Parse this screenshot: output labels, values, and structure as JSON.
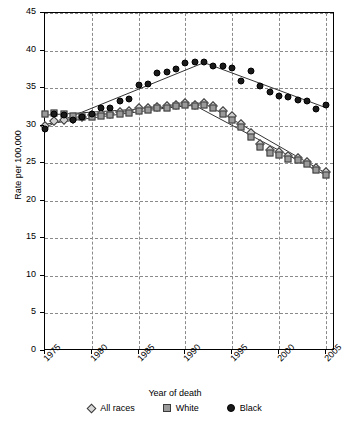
{
  "chart_data": {
    "type": "scatter",
    "title": "",
    "xlabel": "Year of death",
    "ylabel": "Rate per 100,000",
    "xlim": [
      1975,
      2006
    ],
    "ylim": [
      0,
      45
    ],
    "grid": true,
    "legend_position": "bottom",
    "ytick_labels": [
      "0",
      "5",
      "10",
      "15",
      "20",
      "25",
      "30",
      "35",
      "40",
      "45"
    ],
    "ytick_values": [
      0,
      5,
      10,
      15,
      20,
      25,
      30,
      35,
      40,
      45
    ],
    "xtick_labels": [
      "1975",
      "1980",
      "1985",
      "1990",
      "1995",
      "2000",
      "2005"
    ],
    "xtick_values": [
      1975,
      1980,
      1985,
      1990,
      1995,
      2000,
      2005
    ],
    "x": [
      1975,
      1976,
      1977,
      1978,
      1979,
      1980,
      1981,
      1982,
      1983,
      1984,
      1985,
      1986,
      1987,
      1988,
      1989,
      1990,
      1991,
      1992,
      1993,
      1994,
      1995,
      1996,
      1997,
      1998,
      1999,
      2000,
      2001,
      2002,
      2003,
      2004,
      2005
    ],
    "series": [
      {
        "name": "All races",
        "marker": "diamond",
        "color": "#cfcfcf",
        "values": [
          30.0,
          30.6,
          30.7,
          30.9,
          31.1,
          31.4,
          31.5,
          31.6,
          31.8,
          32.0,
          32.3,
          32.4,
          32.5,
          32.6,
          32.8,
          33.0,
          32.8,
          33.0,
          32.6,
          32.0,
          31.3,
          30.2,
          29.0,
          27.6,
          26.8,
          26.5,
          26.0,
          25.7,
          25.2,
          24.4,
          23.8
        ]
      },
      {
        "name": "White",
        "marker": "square",
        "color": "#9a9a9a",
        "values": [
          31.5,
          31.7,
          31.6,
          31.3,
          31.1,
          31.2,
          31.3,
          31.4,
          31.5,
          31.7,
          32.0,
          32.1,
          32.3,
          32.4,
          32.6,
          32.8,
          32.6,
          32.7,
          32.3,
          31.6,
          30.8,
          29.8,
          28.5,
          27.2,
          26.4,
          26.1,
          25.6,
          25.4,
          24.9,
          24.1,
          23.4
        ]
      },
      {
        "name": "Black",
        "marker": "circle",
        "color": "#1a1a1a",
        "values": [
          29.6,
          31.5,
          31.4,
          30.8,
          31.2,
          31.6,
          32.3,
          32.3,
          33.3,
          33.6,
          35.4,
          35.5,
          37.0,
          37.2,
          37.6,
          38.4,
          38.5,
          38.5,
          38.0,
          37.9,
          37.7,
          36.0,
          37.3,
          35.3,
          34.5,
          34.0,
          33.8,
          33.4,
          33.3,
          32.2,
          32.8
        ]
      }
    ],
    "trend_lines": [
      {
        "name": "All races",
        "points": [
          [
            1975,
            30.2
          ],
          [
            1992,
            33.0
          ],
          [
            2005,
            23.7
          ]
        ]
      },
      {
        "name": "White",
        "points": [
          [
            1975,
            31.4
          ],
          [
            1991,
            32.7
          ],
          [
            2005,
            23.4
          ]
        ]
      },
      {
        "name": "Black",
        "points": [
          [
            1975,
            29.8
          ],
          [
            1992,
            38.4
          ],
          [
            2005,
            32.4
          ]
        ]
      }
    ]
  },
  "legend": {
    "items": [
      {
        "label": "All races",
        "marker": "diamond"
      },
      {
        "label": "White",
        "marker": "square"
      },
      {
        "label": "Black",
        "marker": "circle"
      }
    ]
  }
}
